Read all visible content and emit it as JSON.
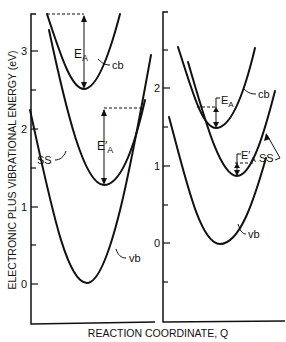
{
  "figure": {
    "ylabel": "ELECTRONIC PLUS VIBRATIONAL ENERGY (eV)",
    "xlabel": "REACTION COORDINATE, Q",
    "left_panel": {
      "ticks": [
        {
          "label": "3",
          "y": 51
        },
        {
          "label": "2",
          "y": 129
        },
        {
          "label": "1",
          "y": 207
        },
        {
          "label": "0",
          "y": 284
        }
      ],
      "curves": {
        "cb": "cb",
        "ss": "SS",
        "vb": "vb"
      },
      "annotations": {
        "ea": "E",
        "ea_sub": "A",
        "ea_prime": "E′",
        "ea_prime_sub": "A"
      }
    },
    "right_panel": {
      "ticks": [
        {
          "label": "2",
          "y": 88
        },
        {
          "label": "1",
          "y": 166
        },
        {
          "label": "0",
          "y": 243
        }
      ],
      "curves": {
        "cb": "cb",
        "ss": "SS",
        "vb": "vb"
      },
      "annotations": {
        "ea": "E",
        "ea_sub": "A",
        "ea_prime": "E′",
        "ea_prime_sub": "A"
      }
    }
  }
}
